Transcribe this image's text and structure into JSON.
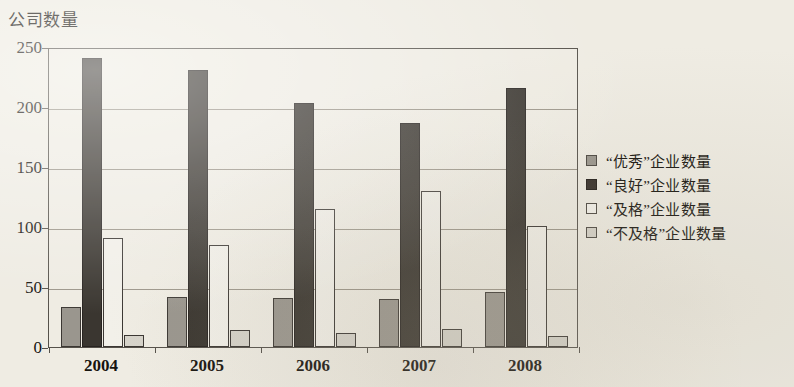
{
  "chart_data": {
    "type": "bar",
    "title": "公司数量",
    "xlabel": "",
    "ylabel": "公司数量",
    "categories": [
      "2004",
      "2005",
      "2006",
      "2007",
      "2008"
    ],
    "series": [
      {
        "name": "“优秀”企业数量",
        "color": "#9a968e",
        "values": [
          33,
          42,
          41,
          40,
          46
        ]
      },
      {
        "name": "“良好”企业数量",
        "color": "#3a3630",
        "values": [
          241,
          231,
          203,
          187,
          216
        ]
      },
      {
        "name": "“及格”企业数量",
        "color": "#f2f0e9",
        "values": [
          91,
          85,
          115,
          130,
          101
        ]
      },
      {
        "name": "“不及格”企业数量",
        "color": "#d6d3ca",
        "values": [
          10,
          14,
          12,
          15,
          9
        ]
      }
    ],
    "ylim": [
      0,
      250
    ],
    "yticks": [
      0,
      50,
      100,
      150,
      200,
      250
    ],
    "ytick_labels": [
      "0",
      "50",
      "100",
      "150",
      "200",
      "250"
    ],
    "grid": true,
    "legend_position": "right"
  }
}
